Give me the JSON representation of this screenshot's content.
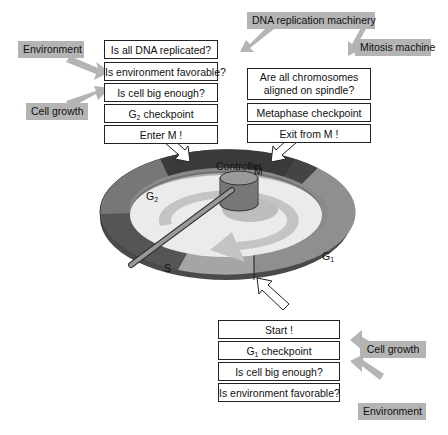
{
  "diagram": {
    "controller_label": "Controller",
    "ring_phases": [
      {
        "label": "M",
        "color": "#3a3a3a"
      },
      {
        "label": "G",
        "sub": "1",
        "color": "#8e8e8e"
      },
      {
        "label": "S",
        "color": "#555555"
      },
      {
        "label": "G",
        "sub": "2",
        "color": "#7a7a7a"
      }
    ],
    "g2_checkpoint": {
      "boxes": [
        "Is all DNA replicated?",
        "Is environment favorable?",
        "Is cell big enough?",
        "G",
        "Enter M !"
      ],
      "checkpoint_main": "G",
      "checkpoint_sub": "2",
      "checkpoint_rest": " checkpoint",
      "inputs": [
        "Environment",
        "Cell growth",
        "DNA replication machinery"
      ]
    },
    "metaphase_checkpoint": {
      "question_line1": "Are all chromosomes",
      "question_line2": "aligned on spindle?",
      "checkpoint": "Metaphase checkpoint",
      "action": "Exit from M !",
      "input": "Mitosis machine"
    },
    "g1_checkpoint": {
      "action": "Start !",
      "checkpoint_main": "G",
      "checkpoint_sub": "1",
      "checkpoint_rest": " checkpoint",
      "q1": "Is cell big enough?",
      "q2": "Is environment favorable?",
      "inputs": [
        "Cell growth",
        "Environment"
      ]
    },
    "phase_labels": {
      "m": "M",
      "g1": "G",
      "g1_sub": "1",
      "s": "S",
      "g2": "G",
      "g2_sub": "2"
    },
    "colors": {
      "tag_bg": "#b4b4b4",
      "box_border": "#222222",
      "ring_dark": "#3a3a3a",
      "ring_mid": "#7a7a7a",
      "ring_light": "#9a9a9a",
      "inner": "#e9e9e9"
    }
  }
}
